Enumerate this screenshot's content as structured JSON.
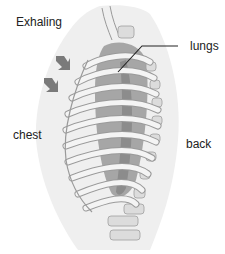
{
  "diagram": {
    "title": "Exhaling",
    "labels": {
      "lungs": "lungs",
      "chest": "chest",
      "back": "back"
    },
    "arrows": {
      "count": 2,
      "direction": "inward (down-right toward chest)",
      "color": "#7a7a7a"
    },
    "colors": {
      "body_silhouette": "#eeeeee",
      "rib": "#f4f4f4",
      "rib_outline": "#9a9a9a",
      "lung": "#a6a6a6",
      "lung_dark": "#8c8c8c",
      "spine": "#dcdcdc",
      "leader_line": "#222222"
    }
  }
}
